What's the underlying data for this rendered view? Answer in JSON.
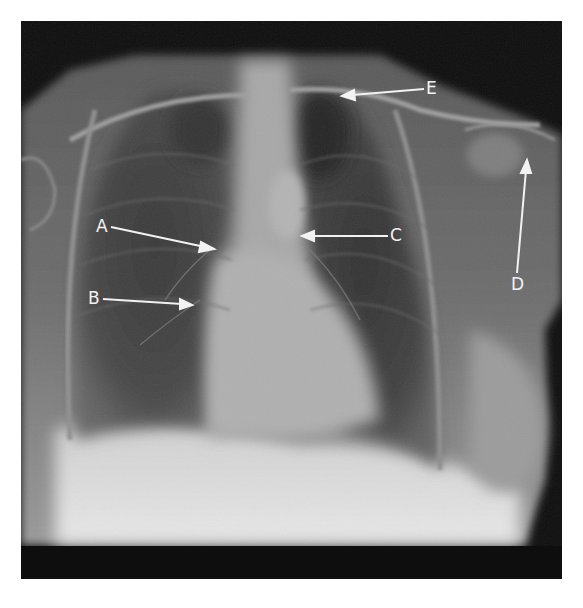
{
  "figure": {
    "type": "chest radiograph (PA view) with annotation arrows",
    "labels": [
      {
        "id": "A",
        "text": "A",
        "label_x": 96,
        "label_y": 218,
        "arrow_from": [
          111,
          227
        ],
        "arrow_to": [
          212,
          249
        ]
      },
      {
        "id": "B",
        "text": "B",
        "label_x": 88,
        "label_y": 290,
        "arrow_from": [
          103,
          299
        ],
        "arrow_to": [
          190,
          305
        ]
      },
      {
        "id": "C",
        "text": "C",
        "label_x": 390,
        "label_y": 227,
        "arrow_from": [
          388,
          236
        ],
        "arrow_to": [
          303,
          236
        ]
      },
      {
        "id": "D",
        "text": "D",
        "label_x": 511,
        "label_y": 276,
        "arrow_from": [
          517,
          273
        ],
        "arrow_to": [
          527,
          162
        ]
      },
      {
        "id": "E",
        "text": "E",
        "label_x": 426,
        "label_y": 80,
        "arrow_from": [
          424,
          89
        ],
        "arrow_to": [
          343,
          96
        ]
      }
    ],
    "colors": {
      "background": "#ffffff",
      "film_border": "#0e0e0e",
      "annotation": "#f2f2f2"
    }
  }
}
